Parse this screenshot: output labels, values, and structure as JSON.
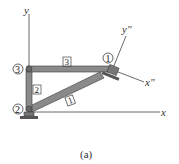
{
  "figure": {
    "caption": "(a)",
    "axes": {
      "x": "x",
      "y": "y",
      "x_local": "x\"",
      "y_local": "y\""
    },
    "nodes": [
      {
        "id": "1",
        "label": "1"
      },
      {
        "id": "2",
        "label": "2"
      },
      {
        "id": "3",
        "label": "3"
      }
    ],
    "members": [
      {
        "id": "1",
        "label": "1",
        "from": "2",
        "to": "1"
      },
      {
        "id": "2",
        "label": "2",
        "from": "2",
        "to": "3"
      },
      {
        "id": "3",
        "label": "3",
        "from": "3",
        "to": "1"
      }
    ],
    "colors": {
      "member_fill": "#8a8a8a",
      "member_edge": "#3a3a3a",
      "axis": "#444444",
      "support": "#555555"
    }
  }
}
